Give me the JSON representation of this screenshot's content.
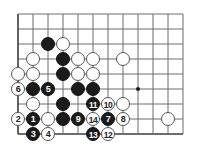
{
  "board": {
    "title": "go-board-diagram",
    "type": "go-problem-diagram",
    "geometry": {
      "origin_x": 18,
      "origin_y": 14,
      "spacing": 15,
      "cols": 12,
      "rows": 9,
      "stone_radius": 7.2
    },
    "colors": {
      "background": "#ffffff",
      "grid_line": "#6d6d6d",
      "edge_line": "#3c3c3c",
      "black_stone": "#1b1b1b",
      "white_stone": "#ffffff",
      "white_stone_border": "#555555",
      "black_label": "#ffffff",
      "white_label": "#222222"
    },
    "hoshi_points": [
      {
        "col": 8,
        "row": 5
      }
    ],
    "stones": [
      {
        "col": 2,
        "row": 2,
        "color": "black",
        "label": ""
      },
      {
        "col": 3,
        "row": 2,
        "color": "white",
        "label": ""
      },
      {
        "col": 1,
        "row": 3,
        "color": "white",
        "label": ""
      },
      {
        "col": 3,
        "row": 3,
        "color": "black",
        "label": ""
      },
      {
        "col": 4,
        "row": 3,
        "color": "white",
        "label": ""
      },
      {
        "col": 5,
        "row": 3,
        "color": "white",
        "label": ""
      },
      {
        "col": 7,
        "row": 3,
        "color": "white",
        "label": ""
      },
      {
        "col": 0,
        "row": 4,
        "color": "white",
        "label": ""
      },
      {
        "col": 1,
        "row": 4,
        "color": "white",
        "label": ""
      },
      {
        "col": 3,
        "row": 4,
        "color": "black",
        "label": ""
      },
      {
        "col": 4,
        "row": 4,
        "color": "white",
        "label": ""
      },
      {
        "col": 5,
        "row": 4,
        "color": "white",
        "label": ""
      },
      {
        "col": 0,
        "row": 5,
        "color": "white",
        "label": "6"
      },
      {
        "col": 1,
        "row": 5,
        "color": "black",
        "label": ""
      },
      {
        "col": 2,
        "row": 5,
        "color": "black",
        "label": "5"
      },
      {
        "col": 4,
        "row": 5,
        "color": "black",
        "label": ""
      },
      {
        "col": 5,
        "row": 5,
        "color": "black",
        "label": ""
      },
      {
        "col": 1,
        "row": 6,
        "color": "white",
        "label": ""
      },
      {
        "col": 3,
        "row": 6,
        "color": "black",
        "label": ""
      },
      {
        "col": 5,
        "row": 6,
        "color": "black",
        "label": "11"
      },
      {
        "col": 6,
        "row": 6,
        "color": "white",
        "label": "10"
      },
      {
        "col": 7,
        "row": 6,
        "color": "white",
        "label": ""
      },
      {
        "col": 0,
        "row": 7,
        "color": "white",
        "label": "2"
      },
      {
        "col": 1,
        "row": 7,
        "color": "black",
        "label": "1"
      },
      {
        "col": 2,
        "row": 7,
        "color": "white",
        "label": ""
      },
      {
        "col": 3,
        "row": 7,
        "color": "black",
        "label": ""
      },
      {
        "col": 4,
        "row": 7,
        "color": "black",
        "label": "9"
      },
      {
        "col": 5,
        "row": 7,
        "color": "white",
        "label": "14"
      },
      {
        "col": 6,
        "row": 7,
        "color": "black",
        "label": "7"
      },
      {
        "col": 7,
        "row": 7,
        "color": "white",
        "label": "8"
      },
      {
        "col": 10,
        "row": 7,
        "color": "white",
        "label": ""
      },
      {
        "col": 1,
        "row": 8,
        "color": "black",
        "label": "3"
      },
      {
        "col": 2,
        "row": 8,
        "color": "white",
        "label": "4"
      },
      {
        "col": 5,
        "row": 8,
        "color": "black",
        "label": "13"
      },
      {
        "col": 6,
        "row": 8,
        "color": "white",
        "label": "12"
      }
    ],
    "move_sequence": [
      {
        "number": "1",
        "color": "black"
      },
      {
        "number": "2",
        "color": "white"
      },
      {
        "number": "3",
        "color": "black"
      },
      {
        "number": "4",
        "color": "white"
      },
      {
        "number": "5",
        "color": "black"
      },
      {
        "number": "6",
        "color": "white"
      },
      {
        "number": "7",
        "color": "black"
      },
      {
        "number": "8",
        "color": "white"
      },
      {
        "number": "9",
        "color": "black"
      },
      {
        "number": "10",
        "color": "white"
      },
      {
        "number": "11",
        "color": "black"
      },
      {
        "number": "12",
        "color": "white"
      },
      {
        "number": "13",
        "color": "black"
      },
      {
        "number": "14",
        "color": "white"
      }
    ]
  }
}
